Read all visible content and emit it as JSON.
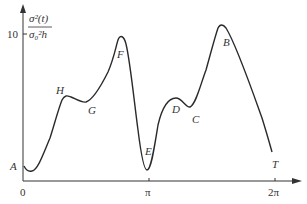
{
  "y_axis": {
    "label_numerator": "σ²(t)",
    "label_denominator": "σ₀²h",
    "tick_10": "10"
  },
  "x_axis": {
    "ticks": [
      "0",
      "π",
      "2π"
    ]
  },
  "points": {
    "A": "A",
    "B": "B",
    "C": "C",
    "D": "D",
    "E": "E",
    "F": "F",
    "G": "G",
    "H": "H",
    "T": "T"
  },
  "colors": {
    "curve": "#2a2a2a",
    "axis": "#333333"
  }
}
